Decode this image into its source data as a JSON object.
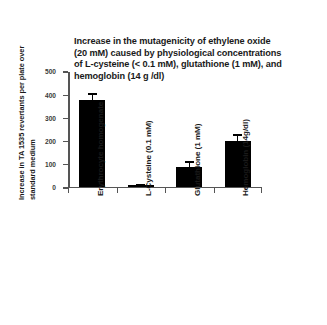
{
  "chart_data": {
    "type": "bar",
    "title": "Increase in the mutagenicity of ethylene oxide\n(20 mM) caused by physiological concentrations\nof L-cysteine (< 0.1 mM), glutathione (1 mM), and\nhemoglobin (14 g /dl)",
    "xlabel": "",
    "ylabel_line1": "Increase in TA 1535 revertants per plate over",
    "ylabel_line2": "standard medium",
    "ylim": [
      0,
      500
    ],
    "yticks": [
      0,
      100,
      200,
      300,
      400,
      500
    ],
    "ytick_labels": [
      "0",
      "100",
      "200",
      "300",
      "400",
      "500"
    ],
    "grid": false,
    "legend": "none",
    "bar_color": "#000000",
    "axis_color": "#555555",
    "categories": [
      "Erythrocyte homogenate",
      "L-Cysteine (0.1 mM)",
      "Glutathione (1 mM)",
      "Hemoglobin (14g/dl)"
    ],
    "values": [
      373,
      4,
      82,
      195
    ],
    "errors": [
      30,
      5,
      26,
      30
    ]
  }
}
